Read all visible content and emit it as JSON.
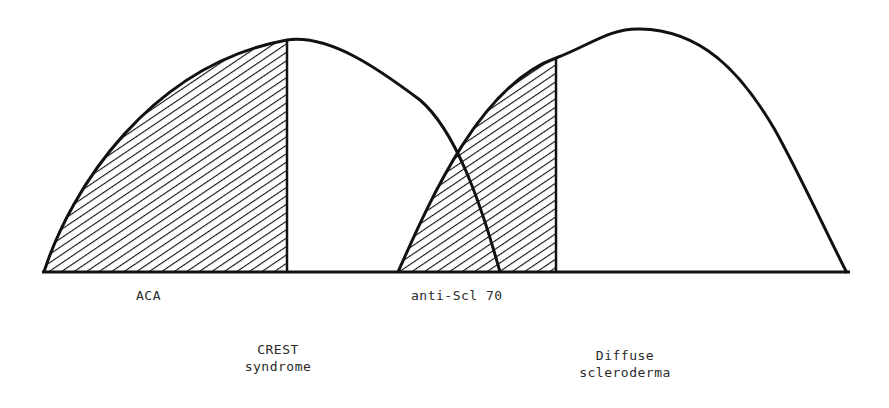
{
  "diagram": {
    "type": "overlapping-distribution-curves",
    "colors": {
      "line": "#111111",
      "hatch": "#111111",
      "background": "#ffffff",
      "text": "#2a2a2a"
    },
    "curves": [
      {
        "name": "crest-syndrome",
        "label_line1": "CREST",
        "label_line2": "syndrome",
        "hatched_portion_label": "ACA"
      },
      {
        "name": "diffuse-scleroderma",
        "label_line1": "Diffuse",
        "label_line2": "scleroderma",
        "hatched_portion_label": "anti-Scl 70"
      }
    ]
  }
}
